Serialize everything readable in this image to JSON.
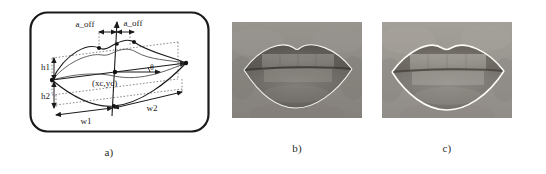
{
  "figure": {
    "background_color": "#ffffff",
    "panels": [
      {
        "id": "a",
        "caption": "a)",
        "type": "diagram",
        "description": "Geometric deformable lip model with parameters",
        "border_color": "#1a1a1a",
        "labels": {
          "a_off_left": "a_off",
          "a_off_right": "a_off",
          "center": "(xc,yc)",
          "h1": "h1",
          "h2": "h2",
          "w1": "w1",
          "w2": "w2",
          "theta": "θ"
        }
      },
      {
        "id": "b",
        "caption": "b)",
        "type": "photo",
        "description": "Grayscale photograph of closed lips with thin white fitted contour overlay",
        "contour_color": "#f2f2ee",
        "skin_tone": "#8d8a85",
        "lip_tone": "#5d5955"
      },
      {
        "id": "c",
        "caption": "c)",
        "type": "photo",
        "description": "Grayscale photograph of lips with bold white fitted contour overlay",
        "contour_color": "#fbfbf7",
        "skin_tone": "#99958f",
        "lip_tone": "#6e6a65"
      }
    ]
  }
}
